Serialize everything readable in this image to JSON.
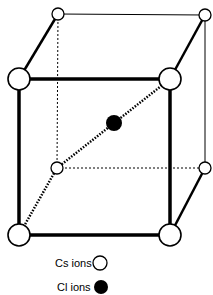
{
  "diagram": {
    "colors": {
      "cs_fill": "#ffffff",
      "cl_fill": "#000000",
      "stroke": "#000000"
    },
    "legend": {
      "cs_label": "Cs ions",
      "cl_label": "Cl ions"
    }
  }
}
